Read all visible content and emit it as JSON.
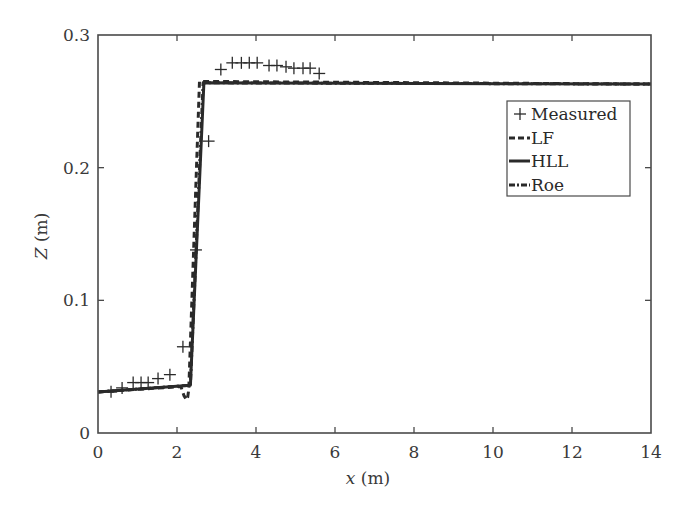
{
  "chart_data": {
    "type": "line",
    "title": "",
    "xlabel": "x (m)",
    "xlabel_var": "x",
    "xlabel_unit": " (m)",
    "ylabel": "Z (m)",
    "ylabel_var": "Z",
    "ylabel_unit": " (m)",
    "xlim": [
      0,
      14
    ],
    "ylim": [
      0,
      0.3
    ],
    "xticks": [
      0,
      2,
      4,
      6,
      8,
      10,
      12,
      14
    ],
    "xtick_labels": [
      "0",
      "2",
      "4",
      "6",
      "8",
      "10",
      "12",
      "14"
    ],
    "yticks": [
      0,
      0.1,
      0.2,
      0.3
    ],
    "ytick_labels": [
      "0",
      "0.1",
      "0.2",
      "0.3"
    ],
    "grid": false,
    "legend_position": "upper right",
    "series": [
      {
        "name": "Measured",
        "kind": "scatter",
        "marker": "+",
        "color": "#2a2a2a",
        "x": [
          0.33,
          0.61,
          0.89,
          1.09,
          1.27,
          1.52,
          1.82,
          2.15,
          2.48,
          2.8,
          3.11,
          3.4,
          3.63,
          3.83,
          4.03,
          4.33,
          4.53,
          4.76,
          4.96,
          5.19,
          5.37,
          5.6
        ],
        "y": [
          0.031,
          0.034,
          0.038,
          0.038,
          0.038,
          0.041,
          0.044,
          0.065,
          0.138,
          0.22,
          0.274,
          0.279,
          0.279,
          0.279,
          0.279,
          0.277,
          0.277,
          0.276,
          0.275,
          0.275,
          0.275,
          0.271
        ]
      },
      {
        "name": "LF",
        "kind": "line",
        "dash": "6,4",
        "color": "#2a2a2a",
        "x": [
          0,
          2.1,
          2.18,
          2.24,
          2.27,
          2.3,
          2.57,
          14
        ],
        "y": [
          0.031,
          0.035,
          0.028,
          0.025,
          0.027,
          0.033,
          0.265,
          0.263
        ]
      },
      {
        "name": "HLL",
        "kind": "line",
        "dash": "",
        "color": "#2a2a2a",
        "x": [
          0,
          2.34,
          2.68,
          14
        ],
        "y": [
          0.031,
          0.036,
          0.264,
          0.263
        ]
      },
      {
        "name": "Roe",
        "kind": "line",
        "dash": "6,3,2,3",
        "color": "#2a2a2a",
        "x": [
          0,
          2.34,
          2.66,
          14
        ],
        "y": [
          0.031,
          0.036,
          0.264,
          0.263
        ]
      }
    ]
  },
  "legend": {
    "items": [
      {
        "symbol": "+",
        "label": "Measured"
      },
      {
        "symbol": "dashed",
        "label": "LF"
      },
      {
        "symbol": "solid",
        "label": "HLL"
      },
      {
        "symbol": "dashdot",
        "label": "Roe"
      }
    ]
  }
}
